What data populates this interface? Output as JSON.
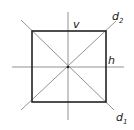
{
  "diagram": {
    "labels": {
      "v": "v",
      "h": "h",
      "d2": "d",
      "d2_sub": "2",
      "d1": "d",
      "d1_sub": "1"
    },
    "colors": {
      "square": "#222222",
      "axes": "#666666",
      "background": "#ffffff"
    }
  }
}
